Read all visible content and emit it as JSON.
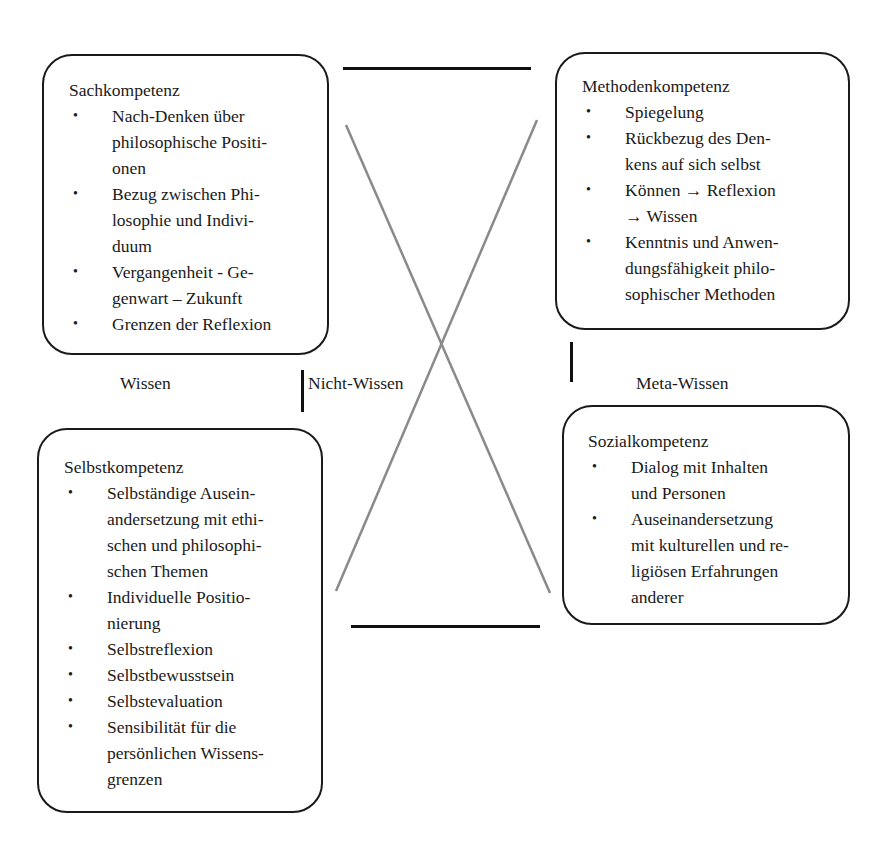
{
  "diagram": {
    "boxes": {
      "sach": {
        "title": "Sachkompetenz",
        "items": [
          "Nach-Denken über\nphilosophische Positi-\nonen",
          "Bezug zwischen Phi-\nlosophie und Indivi-\nduum",
          "Vergangenheit - Ge-\ngenwart – Zukunft",
          "Grenzen der Reflexion"
        ]
      },
      "methoden": {
        "title": "Methodenkompetenz",
        "items": [
          "Spiegelung",
          "Rückbezug des Den-\nkens auf sich selbst",
          "Können → Reflexion\n→ Wissen",
          "Kenntnis und Anwen-\ndungsfähigkeit philo-\nsophischer Methoden"
        ]
      },
      "selbst": {
        "title": "Selbstkompetenz",
        "items": [
          "Selbständige Ausein-\nandersetzung mit ethi-\nschen und philosophi-\nschen Themen",
          "Individuelle Positio-\nnierung",
          "Selbstreflexion",
          "Selbstbewusstsein",
          "Selbstevaluation",
          "Sensibilität für die\npersönlichen Wissens-\ngrenzen"
        ]
      },
      "sozial": {
        "title": "Sozialkompetenz",
        "items": [
          "Dialog mit Inhalten\nund Personen",
          "Auseinandersetzung\nmit kulturellen und re-\nligiösen Erfahrungen\nanderer"
        ]
      }
    },
    "labels": {
      "wissen": "Wissen",
      "nicht_wissen": "Nicht-Wissen",
      "meta_wissen": "Meta-Wissen"
    },
    "bullet_glyph": "•",
    "colors": {
      "stroke": "#1a1a1a",
      "cross": "#8a8a8a",
      "background": "#ffffff"
    }
  }
}
